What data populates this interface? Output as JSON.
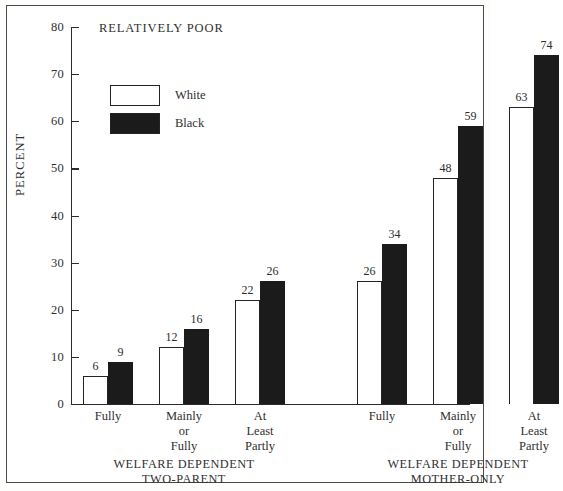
{
  "chart_data": {
    "type": "bar",
    "title": "RELATIVELY POOR",
    "xlabel": "",
    "ylabel": "PERCENT",
    "ylim": [
      0,
      80
    ],
    "ytick_step": 10,
    "yticks": [
      0,
      10,
      20,
      30,
      40,
      50,
      60,
      70,
      80
    ],
    "grid": false,
    "legend_position": "upper-left-inside",
    "categories": [
      "Fully",
      "Mainly\nor\nFully",
      "At\nLeast\nPartly",
      "Fully",
      "Mainly\nor\nFully",
      "At\nLeast\nPartly"
    ],
    "series": [
      {
        "name": "White",
        "color": "#ffffff",
        "values": [
          6,
          12,
          22,
          26,
          48,
          63
        ]
      },
      {
        "name": "Black",
        "color": "#1b1b1b",
        "values": [
          9,
          16,
          26,
          34,
          59,
          74
        ]
      }
    ],
    "groups": [
      {
        "label": "WELFARE DEPENDENT\nTWO-PARENT",
        "categories": [
          "Fully",
          "Mainly\nor\nFully",
          "At\nLeast\nPartly"
        ],
        "white": [
          6,
          12,
          22
        ],
        "black": [
          9,
          16,
          26
        ]
      },
      {
        "label": "WELFARE DEPENDENT\nMOTHER-ONLY",
        "categories": [
          "Fully",
          "Mainly\nor\nFully",
          "At\nLeast\nPartly"
        ],
        "white": [
          26,
          48,
          63
        ],
        "black": [
          34,
          59,
          74
        ]
      }
    ]
  },
  "axis": {
    "y_label": "PERCENT",
    "tick_80": "80",
    "tick_70": "70",
    "tick_60": "60",
    "tick_50": "50",
    "tick_40": "40",
    "tick_30": "30",
    "tick_20": "20",
    "tick_10": "10",
    "tick_0": "0"
  },
  "legend": {
    "white_label": "White",
    "black_label": "Black"
  },
  "labels": {
    "title": "RELATIVELY POOR",
    "cat_1": "Fully",
    "cat_2": "Mainly\nor\nFully",
    "cat_3": "At\nLeast\nPartly",
    "cat_4": "Fully",
    "cat_5": "Mainly\nor\nFully",
    "cat_6": "At\nLeast\nPartly",
    "group_1": "WELFARE DEPENDENT\nTWO-PARENT",
    "group_2": "WELFARE DEPENDENT\nMOTHER-ONLY"
  },
  "values": {
    "g1_fully_white": "6",
    "g1_fully_black": "9",
    "g1_mainly_white": "12",
    "g1_mainly_black": "16",
    "g1_partly_white": "22",
    "g1_partly_black": "26",
    "g2_fully_white": "26",
    "g2_fully_black": "34",
    "g2_mainly_white": "48",
    "g2_mainly_black": "59",
    "g2_partly_white": "63",
    "g2_partly_black": "74"
  }
}
